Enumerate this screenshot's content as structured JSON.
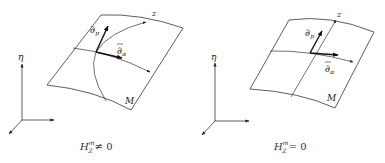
{
  "figure": {
    "panels": [
      {
        "id": "left",
        "surface_label": "M",
        "direction_label": "z",
        "vector_p_label": "∂",
        "vector_p_sub": "p",
        "vector_alpha_label": "∂",
        "vector_alpha_sub": "α",
        "axis_label": "η",
        "caption_main": "H",
        "caption_sup": "m",
        "caption_sub": "Z",
        "caption_rel": "≠ 0"
      },
      {
        "id": "right",
        "surface_label": "M",
        "direction_label": "z",
        "vector_p_label": "∂",
        "vector_p_sub": "p",
        "vector_alpha_label": "∂",
        "vector_alpha_sub": "α",
        "axis_label": "η",
        "caption_main": "H",
        "caption_sup": "m",
        "caption_sub": "Z",
        "caption_rel": "= 0"
      }
    ],
    "colors": {
      "line": "#333333",
      "vector": "#111111",
      "background": "#ffffff"
    }
  }
}
